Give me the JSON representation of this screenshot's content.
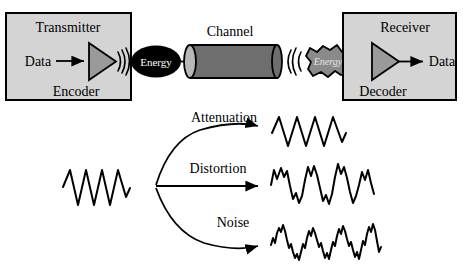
{
  "diagram": {
    "title_implicit": "Data communication: transmitter, channel, receiver and signal impairments",
    "transmitter": {
      "box_label": "Transmitter",
      "input_label": "Data",
      "component_label": "Encoder",
      "box_fill": "#d4d4d4",
      "box_border": "#000000",
      "triangle_fill": "#9a9a9a",
      "icon_amplifier": "encoder-triangle-icon",
      "icon_radiation": "radiating-arcs-icon"
    },
    "energy_sent": {
      "label": "Energy",
      "shape": "ellipse",
      "fill": "#000000",
      "text_color": "#ffffff"
    },
    "channel": {
      "label": "Channel",
      "shape": "cylinder",
      "body_fill": "#6e6e6e",
      "cap_fill": "#b8b8b8",
      "border": "#000000"
    },
    "energy_received": {
      "label": "Energy",
      "shape": "irregular-blob",
      "fill": "#8a8a8a",
      "text_color": "#e8e8e8",
      "style": "italic"
    },
    "receiver": {
      "box_label": "Receiver",
      "output_label": "Data",
      "component_label": "Decoder",
      "box_fill": "#d4d4d4",
      "box_border": "#000000",
      "triangle_fill": "#9a9a9a",
      "icon_amplifier": "decoder-triangle-icon"
    },
    "impairments": {
      "source_wave_name": "original-signal-waveform",
      "branches": [
        {
          "label": "Attenuation",
          "arrow": "curved-up",
          "result_wave_name": "attenuated-waveform",
          "description": "same frequency, reduced amplitude"
        },
        {
          "label": "Distortion",
          "arrow": "straight",
          "result_wave_name": "distorted-waveform",
          "description": "irregular jagged peaks, shape changed"
        },
        {
          "label": "Noise",
          "arrow": "curved-down",
          "result_wave_name": "noisy-waveform",
          "description": "base sine with superimposed random jitter"
        }
      ]
    }
  },
  "colors": {
    "background": "#ffffff",
    "ink": "#000000",
    "box_gray": "#d4d4d4",
    "mid_gray": "#9a9a9a",
    "dark_gray": "#6e6e6e"
  }
}
